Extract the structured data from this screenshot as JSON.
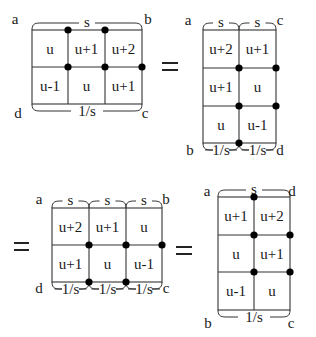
{
  "diagrams": [
    {
      "id": "diagram-1",
      "cols_x": [
        32,
        68,
        105,
        142
      ],
      "rows_y": [
        30,
        67,
        104
      ],
      "cells": [
        [
          "u",
          "u+1",
          "u+2"
        ],
        [
          "u-1",
          "u",
          "u+1"
        ]
      ],
      "dots": [
        [
          68,
          30
        ],
        [
          105,
          30
        ],
        [
          68,
          67
        ],
        [
          105,
          67
        ],
        [
          142,
          67
        ]
      ],
      "top_braces": [
        {
          "x1": 32,
          "x2": 142,
          "label": "s"
        }
      ],
      "bottom_braces": [
        {
          "x1": 32,
          "x2": 142,
          "label": "1/s"
        }
      ],
      "corners": {
        "tl": {
          "label": "a",
          "x": 15,
          "y": 24
        },
        "tr": {
          "label": "b",
          "x": 148,
          "y": 24
        },
        "bl": {
          "label": "d",
          "x": 18,
          "y": 118
        },
        "br": {
          "label": "c",
          "x": 145,
          "y": 118
        }
      }
    },
    {
      "id": "diagram-2",
      "cols_x": [
        203,
        239,
        276
      ],
      "rows_y": [
        30,
        68,
        106,
        143
      ],
      "cells": [
        [
          "u+2",
          "u+1"
        ],
        [
          "u+1",
          "u"
        ],
        [
          "u",
          "u-1"
        ]
      ],
      "dots": [
        [
          239,
          68
        ],
        [
          276,
          68
        ],
        [
          239,
          106
        ],
        [
          276,
          106
        ],
        [
          239,
          143
        ]
      ],
      "top_braces": [
        {
          "x1": 203,
          "x2": 239,
          "label": "s"
        },
        {
          "x1": 239,
          "x2": 276,
          "label": "s"
        }
      ],
      "bottom_braces": [
        {
          "x1": 203,
          "x2": 239,
          "label": "1/s"
        },
        {
          "x1": 239,
          "x2": 276,
          "label": "1/s"
        }
      ],
      "corners": {
        "tl": {
          "label": "a",
          "x": 188,
          "y": 25
        },
        "tr": {
          "label": "c",
          "x": 280,
          "y": 25
        },
        "bl": {
          "label": "b",
          "x": 190,
          "y": 155
        },
        "br": {
          "label": "d",
          "x": 280,
          "y": 155
        }
      }
    },
    {
      "id": "diagram-3",
      "cols_x": [
        52,
        89,
        126,
        162
      ],
      "rows_y": [
        208,
        245,
        282
      ],
      "cells": [
        [
          "u+2",
          "u+1",
          "u"
        ],
        [
          "u+1",
          "u",
          "u-1"
        ]
      ],
      "dots": [
        [
          89,
          245
        ],
        [
          126,
          245
        ],
        [
          162,
          245
        ],
        [
          89,
          282
        ],
        [
          126,
          282
        ]
      ],
      "top_braces": [
        {
          "x1": 52,
          "x2": 89,
          "label": "s"
        },
        {
          "x1": 89,
          "x2": 126,
          "label": "s"
        },
        {
          "x1": 126,
          "x2": 162,
          "label": "s"
        }
      ],
      "bottom_braces": [
        {
          "x1": 52,
          "x2": 89,
          "label": "1/s"
        },
        {
          "x1": 89,
          "x2": 126,
          "label": "1/s"
        },
        {
          "x1": 126,
          "x2": 162,
          "label": "1/s"
        }
      ],
      "corners": {
        "tl": {
          "label": "a",
          "x": 39,
          "y": 204
        },
        "tr": {
          "label": "b",
          "x": 166,
          "y": 204
        },
        "bl": {
          "label": "d",
          "x": 39,
          "y": 293
        },
        "br": {
          "label": "c",
          "x": 166,
          "y": 293
        }
      }
    },
    {
      "id": "diagram-4",
      "cols_x": [
        218,
        254,
        290
      ],
      "rows_y": [
        197,
        235,
        272,
        310
      ],
      "cells": [
        [
          "u+1",
          "u+2"
        ],
        [
          "u",
          "u+1"
        ],
        [
          "u-1",
          "u"
        ]
      ],
      "dots": [
        [
          254,
          197
        ],
        [
          254,
          235
        ],
        [
          290,
          235
        ],
        [
          254,
          272
        ],
        [
          290,
          272
        ]
      ],
      "top_braces": [
        {
          "x1": 218,
          "x2": 290,
          "label": "s"
        }
      ],
      "bottom_braces": [
        {
          "x1": 218,
          "x2": 290,
          "label": "1/s"
        }
      ],
      "corners": {
        "tl": {
          "label": "a",
          "x": 207,
          "y": 196
        },
        "tr": {
          "label": "d",
          "x": 292,
          "y": 196
        },
        "bl": {
          "label": "b",
          "x": 208,
          "y": 328
        },
        "br": {
          "label": "c",
          "x": 291,
          "y": 328
        }
      }
    }
  ],
  "equals_signs": [
    {
      "x": 162,
      "y": 66,
      "w": 16
    },
    {
      "x": 14,
      "y": 246,
      "w": 15
    },
    {
      "x": 176,
      "y": 250,
      "w": 16
    }
  ],
  "colors": {
    "line": "#333333",
    "dot": "#000000",
    "text": "#1a1a1a",
    "background": "#ffffff"
  }
}
